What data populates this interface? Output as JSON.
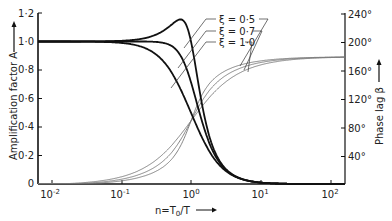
{
  "chart_data": {
    "type": "line",
    "title": "",
    "xscale": "log",
    "xlabel": "n=T0/T",
    "ylabel_left": "Amplification factor A",
    "ylabel_right": "Phase lag β",
    "xlim": [
      0.006,
      200
    ],
    "ylim_left": [
      0,
      1.2
    ],
    "ylim_right": [
      0,
      240
    ],
    "x_ticks": [
      "10^-2",
      "10^-1",
      "10^0",
      "10^1",
      "10^2"
    ],
    "y_left_ticks": [
      "0",
      "0·2",
      "0·4",
      "0·6",
      "0·8",
      "1·0",
      "1·2"
    ],
    "y_right_ticks": [
      "40°",
      "80°",
      "120°",
      "160°",
      "200°",
      "240°"
    ],
    "legend": [
      "ξ = 0·5",
      "ξ = 0·7",
      "ξ = 1·0"
    ],
    "grid": false,
    "series": [
      {
        "name": "A, ξ=0.5",
        "axis": "left",
        "style": "thick-black",
        "x": [
          0.01,
          0.1,
          0.3,
          0.5,
          0.7,
          0.8,
          1.0,
          1.5,
          2,
          3,
          5,
          10,
          100
        ],
        "values": [
          1.0,
          1.005,
          1.04,
          1.11,
          1.15,
          1.09,
          1.0,
          0.55,
          0.3,
          0.12,
          0.041,
          0.01,
          0.0001
        ]
      },
      {
        "name": "A, ξ=0.7",
        "axis": "left",
        "style": "thick-black",
        "x": [
          0.01,
          0.1,
          0.3,
          0.5,
          0.7,
          1.0,
          1.5,
          2,
          3,
          5,
          10,
          100
        ],
        "values": [
          1.0,
          1.0,
          1.0,
          0.97,
          0.89,
          0.71,
          0.44,
          0.25,
          0.11,
          0.04,
          0.01,
          0.0001
        ]
      },
      {
        "name": "A, ξ=1.0",
        "axis": "left",
        "style": "thick-black",
        "x": [
          0.01,
          0.1,
          0.3,
          0.5,
          0.7,
          1.0,
          1.5,
          2,
          3,
          5,
          10,
          100
        ],
        "values": [
          1.0,
          0.99,
          0.92,
          0.8,
          0.67,
          0.5,
          0.31,
          0.2,
          0.1,
          0.038,
          0.0099,
          0.0001
        ]
      },
      {
        "name": "β, ξ=0.5",
        "axis": "right",
        "style": "thin-grey",
        "x": [
          0.01,
          0.1,
          0.3,
          0.5,
          1.0,
          2,
          3,
          5,
          10,
          100
        ],
        "values": [
          0.6,
          5.8,
          18.3,
          33.7,
          90,
          146.3,
          159.4,
          167.6,
          174.2,
          179.4
        ]
      },
      {
        "name": "β, ξ=0.7",
        "axis": "right",
        "style": "thin-grey",
        "x": [
          0.01,
          0.1,
          0.3,
          0.5,
          1.0,
          2,
          3,
          5,
          10,
          100
        ],
        "values": [
          0.8,
          8.1,
          24.8,
          43.0,
          90,
          137.0,
          152.2,
          163.7,
          171.9,
          179.2
        ]
      },
      {
        "name": "β, ξ=1.0",
        "axis": "right",
        "style": "thin-grey",
        "x": [
          0.01,
          0.1,
          0.3,
          0.5,
          1.0,
          2,
          3,
          5,
          10,
          100
        ],
        "values": [
          1.1,
          11.4,
          33.4,
          53.1,
          90,
          126.9,
          143.1,
          157.4,
          168.6,
          178.9
        ]
      }
    ],
    "damping_ratios": [
      0.5,
      0.7,
      1.0
    ]
  },
  "labels": {
    "x_axis": "n=T",
    "x_axis_sub": "0",
    "x_axis_tail": "/T",
    "y_left": "Amplification factor  A",
    "y_right": "Phase  lag  β",
    "legend_0": "ξ = 0·5",
    "legend_1": "ξ = 0·7",
    "legend_2": "ξ = 1·0",
    "xt0": "10",
    "xt0e": "-2",
    "xt1": "10",
    "xt1e": "-1",
    "xt2": "10",
    "xt2e": "0",
    "xt3": "10",
    "xt3e": "1",
    "xt4": "10",
    "xt4e": "2",
    "yl0": "0",
    "yl1": "0·2",
    "yl2": "0·4",
    "yl3": "0·6",
    "yl4": "0·8",
    "yl5": "1·0",
    "yl6": "1·2",
    "yr1": "40°",
    "yr2": "80°",
    "yr3": "120°",
    "yr4": "160°",
    "yr5": "200°",
    "yr6": "240°"
  }
}
